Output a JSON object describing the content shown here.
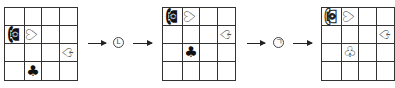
{
  "panels": [
    {
      "id": "start",
      "cells": [
        [
          "",
          "",
          "",
          ""
        ],
        [
          "☎",
          "♡",
          "",
          ""
        ],
        [
          "",
          "",
          "",
          "♤"
        ],
        [
          "",
          "♣",
          "",
          ""
        ]
      ]
    },
    {
      "id": "after-first-transform",
      "cells": [
        [
          "☎",
          "♡",
          "",
          ""
        ],
        [
          "",
          "",
          "",
          "♤"
        ],
        [
          "",
          "♣",
          "",
          ""
        ],
        [
          "",
          "",
          "",
          ""
        ]
      ]
    },
    {
      "id": "after-second-transform",
      "cells": [
        [
          "☎",
          "♡",
          "",
          ""
        ],
        [
          "",
          "",
          "",
          "♤"
        ],
        [
          "",
          "♧",
          "",
          ""
        ],
        [
          "",
          "",
          "",
          ""
        ]
      ]
    }
  ],
  "operations": [
    {
      "symbol": "L",
      "label": "circled-L"
    },
    {
      "symbol": "ㄱ",
      "label": "circled-ㄱ"
    }
  ],
  "colors": {
    "line": "#333333",
    "ink": "#111111"
  }
}
